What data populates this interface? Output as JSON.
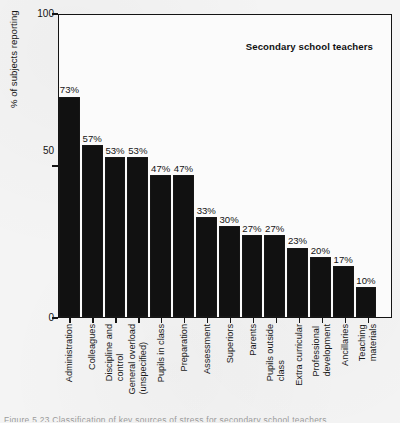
{
  "chart_data": {
    "type": "bar",
    "title": "Secondary school teachers",
    "xlabel": "",
    "ylabel": "% of subjects reporting",
    "ylim": [
      0,
      100
    ],
    "yticks": [
      0,
      50,
      100
    ],
    "ytick_labels": [
      "0",
      "50",
      "100"
    ],
    "grid": false,
    "legend": null,
    "orientation": "vertical",
    "bar_color": "#111111",
    "categories": [
      "Administration",
      "Colleagues",
      "Discipline and control",
      "General overload (unspecified)",
      "Pupils in class",
      "Preparation",
      "Assessment",
      "Superiors",
      "Parents",
      "Pupils outside class",
      "Extra curricular",
      "Professional development",
      "Ancillaries",
      "Teaching materials"
    ],
    "category_lines": [
      [
        "Administration"
      ],
      [
        "Colleagues"
      ],
      [
        "Discipline and",
        "control"
      ],
      [
        "General overload",
        "(unspecified)"
      ],
      [
        "Pupils in class"
      ],
      [
        "Preparation"
      ],
      [
        "Assessment"
      ],
      [
        "Superiors"
      ],
      [
        "Parents"
      ],
      [
        "Pupils outside",
        "class"
      ],
      [
        "Extra curricular"
      ],
      [
        "Professional",
        "development"
      ],
      [
        "Ancillaries"
      ],
      [
        "Teaching",
        "materials"
      ]
    ],
    "values": [
      73,
      57,
      53,
      53,
      47,
      47,
      33,
      30,
      27,
      27,
      23,
      20,
      17,
      10
    ],
    "value_labels": [
      "73%",
      "57%",
      "53%",
      "53%",
      "47%",
      "47%",
      "33%",
      "30%",
      "27%",
      "27%",
      "23%",
      "20%",
      "17%",
      "10%"
    ]
  },
  "axis": {
    "y_label": "% of subjects reporting",
    "y_tick_top": "100",
    "y_tick_mid": "50",
    "y_tick_bottom": "0"
  },
  "title": {
    "text": "Secondary school teachers"
  },
  "caption": {
    "text": "Figure 5.23   Classification of key sources of stress for secondary school teachers"
  },
  "colors": {
    "bar": "#111111",
    "axis": "#141414",
    "page_background": "#f4f4f4",
    "plot_background": "#fbfbfb",
    "text": "#141414"
  }
}
